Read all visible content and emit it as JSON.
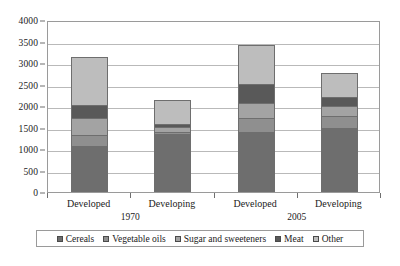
{
  "chart_data": {
    "type": "bar",
    "stacked": true,
    "title": "",
    "xlabel": "",
    "ylabel": "",
    "ylim": [
      0,
      4000
    ],
    "ytick_step": 500,
    "yticks": [
      "4000",
      "3500",
      "3000",
      "2500",
      "2000",
      "1500",
      "1000",
      "500",
      "0"
    ],
    "grid": true,
    "legend_position": "bottom",
    "categories": [
      "Developed",
      "Developing",
      "Developed",
      "Developing"
    ],
    "groups": [
      {
        "label": "1970",
        "categories": [
          "Developed",
          "Developing"
        ]
      },
      {
        "label": "2005",
        "categories": [
          "Developed",
          "Developing"
        ]
      }
    ],
    "series": [
      {
        "name": "Cereals",
        "color": "#6e6e6e",
        "values": [
          1050,
          1330,
          1370,
          1460
        ]
      },
      {
        "name": "Vegetable oils",
        "color": "#8f8f8f",
        "values": [
          250,
          40,
          330,
          300
        ]
      },
      {
        "name": "Sugar and sweeteners",
        "color": "#a3a3a3",
        "values": [
          410,
          130,
          360,
          230
        ]
      },
      {
        "name": "Meat",
        "color": "#595959",
        "values": [
          290,
          70,
          430,
          200
        ]
      },
      {
        "name": "Other",
        "color": "#bdbdbd",
        "values": [
          1150,
          580,
          940,
          580
        ]
      }
    ],
    "totals": [
      3150,
      2150,
      3430,
      2770
    ]
  },
  "axis": {
    "yticks": [
      {
        "label": "4000",
        "value": 4000
      },
      {
        "label": "3500",
        "value": 3500
      },
      {
        "label": "3000",
        "value": 3000
      },
      {
        "label": "2500",
        "value": 2500
      },
      {
        "label": "2000",
        "value": 2000
      },
      {
        "label": "1500",
        "value": 1500
      },
      {
        "label": "1000",
        "value": 1000
      },
      {
        "label": "500",
        "value": 500
      },
      {
        "label": "0",
        "value": 0
      }
    ],
    "xlabels": [
      "Developed",
      "Developing",
      "Developed",
      "Developing"
    ],
    "grouplabels": [
      "1970",
      "2005"
    ]
  },
  "legend": {
    "items": [
      {
        "label": "Cereals",
        "color": "#6e6e6e"
      },
      {
        "label": "Vegetable oils",
        "color": "#8f8f8f"
      },
      {
        "label": "Sugar and sweeteners",
        "color": "#a3a3a3"
      },
      {
        "label": "Meat",
        "color": "#595959"
      },
      {
        "label": "Other",
        "color": "#bdbdbd"
      }
    ]
  }
}
